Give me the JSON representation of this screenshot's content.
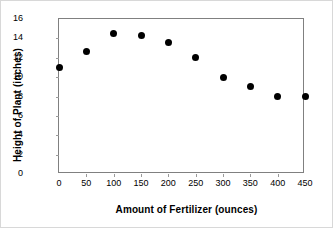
{
  "chart_data": {
    "type": "scatter",
    "title": "",
    "xlabel": "Amount of Fertilizer (ounces)",
    "ylabel": "Height of Plant (inches)",
    "x": [
      0,
      50,
      100,
      150,
      200,
      250,
      300,
      350,
      400,
      450
    ],
    "values": [
      11.0,
      12.6,
      14.5,
      14.3,
      13.6,
      12.0,
      10.0,
      9.0,
      8.0,
      8.0
    ],
    "series": [
      {
        "name": "Height of Plant",
        "values": [
          11.0,
          12.6,
          14.5,
          14.3,
          13.6,
          12.0,
          10.0,
          9.0,
          8.0,
          8.0
        ]
      }
    ],
    "xlim": [
      0,
      450
    ],
    "ylim": [
      0,
      16
    ],
    "xticks": [
      0,
      50,
      100,
      150,
      200,
      250,
      300,
      350,
      400,
      450
    ],
    "yticks": [
      0,
      2,
      4,
      6,
      8,
      10,
      12,
      14,
      16
    ],
    "xtick_labels": [
      "0",
      "50",
      "100",
      "150",
      "200",
      "250",
      "300",
      "350",
      "400",
      "450"
    ],
    "ytick_labels": [
      "0",
      "2",
      "4",
      "6",
      "8",
      "10",
      "12",
      "14",
      "16"
    ],
    "grid": false,
    "legend": false,
    "legend_position": "none",
    "marker_color": "#000000",
    "frame_color": "#808080"
  }
}
